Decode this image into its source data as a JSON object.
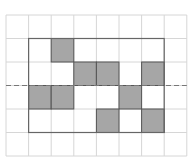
{
  "diagram": {
    "grid": {
      "columns": 8,
      "rows": 6,
      "origin_x": 6,
      "origin_y": 15,
      "cell_width": 22.6,
      "cell_height": 23.5,
      "line_color": "#d6d6d6"
    },
    "outline": {
      "col_start": 1,
      "row_start": 1,
      "col_end": 7,
      "row_end": 5,
      "color": "#666666"
    },
    "dashed_line": {
      "row_boundary": 3,
      "color": "#777777"
    },
    "shaded_cells": [
      {
        "col": 2,
        "row": 1
      },
      {
        "col": 3,
        "row": 2
      },
      {
        "col": 4,
        "row": 2
      },
      {
        "col": 6,
        "row": 2
      },
      {
        "col": 1,
        "row": 3
      },
      {
        "col": 2,
        "row": 3
      },
      {
        "col": 5,
        "row": 3
      },
      {
        "col": 4,
        "row": 4
      },
      {
        "col": 6,
        "row": 4
      }
    ],
    "shade_color": "#a6a6a6",
    "shade_border": "#555555"
  }
}
